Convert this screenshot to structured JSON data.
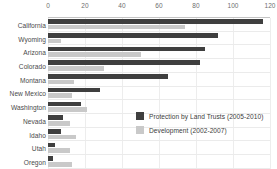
{
  "chart_data": {
    "type": "bar",
    "orientation": "horizontal",
    "title": "",
    "xlabel": "",
    "ylabel": "",
    "xlim": [
      0,
      120
    ],
    "xticks": [
      0,
      20,
      40,
      60,
      80,
      100,
      120
    ],
    "grid": true,
    "legend_position": "inside-right",
    "categories": [
      "California",
      "Wyoming",
      "Arizona",
      "Colorado",
      "Montana",
      "New Mexico",
      "Washington",
      "Nevada",
      "Idaho",
      "Utah",
      "Oregon"
    ],
    "series": [
      {
        "name": "Protection by Land Trusts (2005-2010)",
        "color": "#3f3f3f",
        "values": [
          116,
          92,
          85,
          82,
          65,
          28,
          18,
          8,
          7,
          4,
          2.5
        ]
      },
      {
        "name": "Development (2002-2007)",
        "color": "#c9c9c9",
        "values": [
          74,
          7,
          50,
          30,
          14,
          13,
          21,
          12,
          15,
          12,
          13
        ]
      }
    ]
  },
  "legend": {
    "items": [
      {
        "label": "Protection by Land Trusts (2005-2010)",
        "swatch": "dark"
      },
      {
        "label": "Development (2002-2007)",
        "swatch": "light"
      }
    ]
  },
  "colors": {
    "dark": "#3f3f3f",
    "light": "#c9c9c9",
    "grid": "#ededed",
    "axis_text": "#6e6e6e",
    "label_text": "#4a4a4a"
  }
}
